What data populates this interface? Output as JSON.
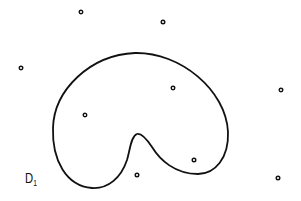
{
  "diagram": {
    "type": "point-set-with-closed-curve",
    "background": "#ffffff",
    "stroke_color": "#111111",
    "region_label": {
      "main": "D",
      "subscript": "1"
    },
    "curve": {
      "description": "closed kidney-shaped curve with an inward notch at bottom",
      "path": "M 92 188 C 66 186, 52 160, 53 128 C 54 90, 90 55, 135 53 C 180 52, 226 90, 228 132 C 229 158, 215 174, 198 174 C 175 174, 160 160, 152 147 C 146 138, 141 133, 137 134 C 131 136, 130 150, 127 160 C 121 178, 108 189, 92 188 Z"
    },
    "points": [
      {
        "x": 81,
        "y": 12
      },
      {
        "x": 163,
        "y": 22
      },
      {
        "x": 21,
        "y": 68
      },
      {
        "x": 173,
        "y": 88
      },
      {
        "x": 281,
        "y": 90
      },
      {
        "x": 85,
        "y": 115
      },
      {
        "x": 194,
        "y": 160
      },
      {
        "x": 137,
        "y": 175
      },
      {
        "x": 278,
        "y": 178
      }
    ]
  }
}
